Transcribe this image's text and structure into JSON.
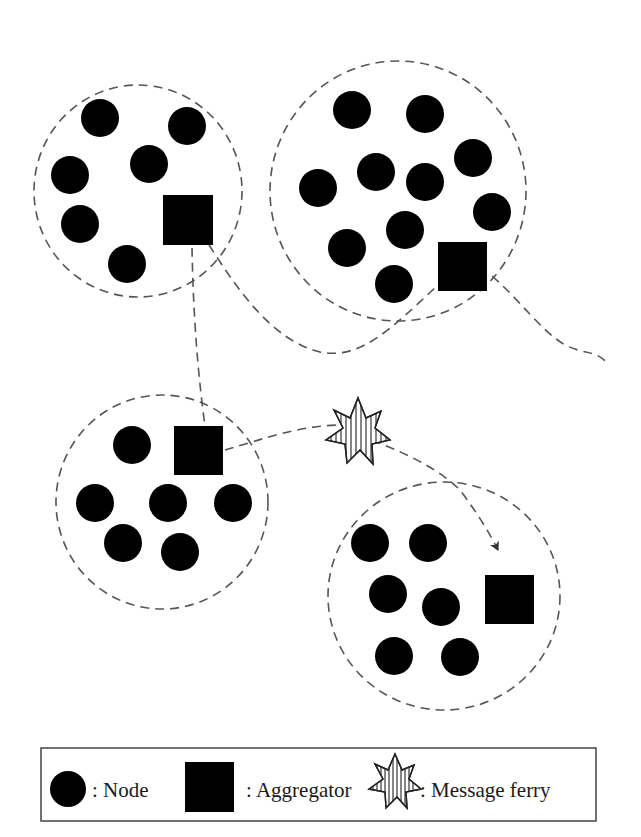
{
  "diagram": {
    "type": "network-topology",
    "colors": {
      "node": "#000000",
      "aggregator": "#000000",
      "dashed_line": "#555555",
      "ferry_outline": "#222222",
      "background": "#ffffff"
    },
    "clusters": [
      {
        "id": "cluster-top-left",
        "center": [
          138,
          191
        ],
        "radius": [
          104,
          106
        ],
        "nodes": [
          [
            100,
            118
          ],
          [
            187,
            126
          ],
          [
            70,
            175
          ],
          [
            149,
            164
          ],
          [
            80,
            224
          ],
          [
            127,
            264
          ]
        ],
        "aggregator": [
          163,
          195,
          50,
          50
        ]
      },
      {
        "id": "cluster-top-right",
        "center": [
          398,
          191
        ],
        "radius": [
          128,
          130
        ],
        "nodes": [
          [
            352,
            110
          ],
          [
            425,
            114
          ],
          [
            473,
            158
          ],
          [
            318,
            188
          ],
          [
            376,
            172
          ],
          [
            425,
            182
          ],
          [
            492,
            212
          ],
          [
            347,
            248
          ],
          [
            405,
            230
          ],
          [
            394,
            284
          ]
        ],
        "aggregator": [
          438,
          242,
          49,
          49
        ]
      },
      {
        "id": "cluster-mid-left",
        "center": [
          162,
          502
        ],
        "radius": [
          106,
          107
        ],
        "nodes": [
          [
            132,
            445
          ],
          [
            95,
            503
          ],
          [
            168,
            503
          ],
          [
            233,
            503
          ],
          [
            123,
            543
          ],
          [
            180,
            552
          ]
        ],
        "aggregator": [
          174,
          426,
          49,
          49
        ]
      },
      {
        "id": "cluster-bottom-right",
        "center": [
          444,
          596
        ],
        "radius": [
          116,
          114
        ],
        "nodes": [
          [
            370,
            543
          ],
          [
            428,
            543
          ],
          [
            388,
            594
          ],
          [
            441,
            607
          ],
          [
            394,
            656
          ],
          [
            460,
            657
          ]
        ],
        "aggregator": [
          485,
          575,
          49,
          49
        ]
      }
    ],
    "message_ferry": {
      "center": [
        358,
        433
      ]
    },
    "paths": [
      {
        "id": "path-agg1-to-agg3",
        "style": "dashed"
      },
      {
        "id": "path-agg1-to-agg2-curve",
        "style": "dashed"
      },
      {
        "id": "path-agg2-to-offscreen",
        "style": "dashed"
      },
      {
        "id": "path-agg3-to-ferry",
        "style": "dashed"
      },
      {
        "id": "path-ferry-to-cluster4",
        "style": "dashed-arrow"
      }
    ]
  },
  "legend": {
    "items": [
      {
        "symbol": "node",
        "label": ": Node"
      },
      {
        "symbol": "aggregator",
        "label": ": Aggregator"
      },
      {
        "symbol": "message-ferry",
        "label": ": Message ferry"
      }
    ]
  }
}
